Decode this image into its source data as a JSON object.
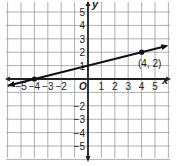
{
  "chart_data": {
    "type": "line",
    "title": "",
    "xlabel": "x",
    "ylabel": "y",
    "xlim": [
      -5,
      5
    ],
    "ylim": [
      -5,
      5
    ],
    "grid": true,
    "origin_label": "O",
    "x_ticks": [
      -5,
      -4,
      -3,
      -2,
      1,
      2,
      3,
      4,
      5
    ],
    "y_ticks": [
      5,
      4,
      3,
      2,
      1,
      -2,
      -3,
      -4,
      -5
    ],
    "series": [
      {
        "name": "line",
        "equation": "y = 0.25x + 1",
        "slope": 0.25,
        "intercept": 1,
        "points": [
          {
            "x": -4,
            "y": 0
          },
          {
            "x": 4,
            "y": 2
          }
        ]
      }
    ],
    "annotations": [
      {
        "text": "(4, 2)",
        "x": 4,
        "y": 2
      }
    ]
  },
  "labels": {
    "x_axis": "x",
    "y_axis": "y",
    "origin": "O",
    "point_label": "(4, 2)"
  },
  "colors": {
    "grid": "#9a9a9a",
    "axis": "#222222",
    "line": "#111111",
    "text": "#222222"
  }
}
